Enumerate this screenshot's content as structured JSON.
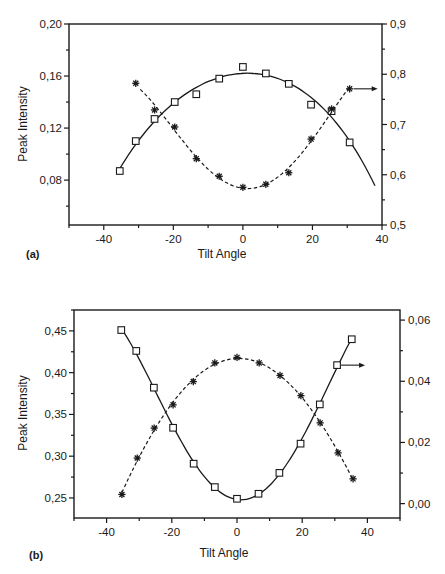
{
  "chart_data": [
    {
      "panel_label": "(a)",
      "type": "scatter",
      "xlabel": "Tilt Angle",
      "ylabel": "Peak Intensity",
      "y2label": "",
      "xlim": [
        -50,
        40
      ],
      "ylim": [
        0.0455,
        0.2
      ],
      "y2lim": [
        0.5,
        0.9
      ],
      "xticks": [
        -40,
        -20,
        0,
        20,
        40
      ],
      "xtick_labels": [
        "-40",
        "-20",
        "0",
        "20",
        "40"
      ],
      "yticks": [
        0.08,
        0.12,
        0.16,
        0.2
      ],
      "ytick_labels": [
        "0,08",
        "0,12",
        "0,16",
        "0,20"
      ],
      "y2ticks": [
        0.5,
        0.6,
        0.7,
        0.8,
        0.9
      ],
      "y2tick_labels": [
        "0,5",
        "0,6",
        "0,7",
        "0,8",
        "0,9"
      ],
      "grid": false,
      "legend": "none",
      "series": [
        {
          "name": "squares",
          "marker": "square",
          "axis": "left",
          "fit": "solid",
          "x": [
            -35.4,
            -30.8,
            -25.4,
            -19.6,
            -13.4,
            -6.8,
            0,
            6.6,
            13.2,
            19.6,
            25.5,
            30.7
          ],
          "y": [
            0.087,
            0.11,
            0.127,
            0.14,
            0.146,
            0.158,
            0.167,
            0.162,
            0.154,
            0.138,
            0.133,
            0.109
          ],
          "fit_amp": 0.167,
          "fit_width": 56,
          "fit_x0": 1,
          "fit_base": 0.0,
          "fit_range": [
            -35.4,
            38
          ]
        },
        {
          "name": "asterisks",
          "marker": "asterisk",
          "axis": "right",
          "fit": "dashed",
          "arrow": "right",
          "x": [
            -30.8,
            -25.4,
            -19.6,
            -13.4,
            -6.8,
            0,
            6.6,
            13.2,
            19.6,
            25.5,
            30.7
          ],
          "y": [
            0.782,
            0.729,
            0.695,
            0.632,
            0.597,
            0.575,
            0.581,
            0.604,
            0.671,
            0.731,
            0.771
          ],
          "fit_range": [
            -29.5,
            30.7
          ]
        }
      ]
    },
    {
      "panel_label": "(b)",
      "type": "scatter",
      "xlabel": "Tilt Angle",
      "ylabel": "Peak Intensity",
      "y2label": "",
      "xlim": [
        -50,
        50
      ],
      "ylim": [
        0.226,
        0.475
      ],
      "y2lim": [
        -0.0047,
        0.0633
      ],
      "xticks": [
        -40,
        -20,
        0,
        20,
        40
      ],
      "xtick_labels": [
        "-40",
        "-20",
        "0",
        "20",
        "40"
      ],
      "yticks": [
        0.25,
        0.3,
        0.35,
        0.4,
        0.45
      ],
      "ytick_labels": [
        "0,25",
        "0,30",
        "0,35",
        "0,40",
        "0,45"
      ],
      "y2ticks": [
        0.0,
        0.02,
        0.04,
        0.06
      ],
      "y2tick_labels": [
        "0,00",
        "0,02",
        "0,04",
        "0,06"
      ],
      "grid": false,
      "legend": "none",
      "series": [
        {
          "name": "squares",
          "marker": "square",
          "axis": "left",
          "fit": "solid",
          "arrow": "right",
          "arrow_point_index": 11,
          "x": [
            -35.5,
            -30.9,
            -25.5,
            -19.6,
            -13.3,
            -6.8,
            0,
            6.6,
            13.0,
            19.5,
            25.4,
            30.7,
            35.2
          ],
          "y": [
            0.451,
            0.426,
            0.382,
            0.334,
            0.291,
            0.263,
            0.249,
            0.255,
            0.28,
            0.315,
            0.362,
            0.409,
            0.44
          ],
          "fit_range": [
            -34.5,
            35
          ]
        },
        {
          "name": "asterisks",
          "marker": "asterisk",
          "axis": "right",
          "fit": "dashed",
          "x": [
            -35.3,
            -30.6,
            -25.4,
            -19.6,
            -13.4,
            -6.8,
            0,
            6.8,
            13.2,
            19.6,
            25.5,
            31.0,
            35.6
          ],
          "y": [
            0.003,
            0.0149,
            0.0247,
            0.0323,
            0.0399,
            0.046,
            0.0478,
            0.046,
            0.0419,
            0.0353,
            0.0264,
            0.0166,
            0.0081
          ],
          "fit_range": [
            -35.3,
            35.6
          ]
        }
      ]
    }
  ],
  "panels": [
    {
      "label": "(a)",
      "xlabel": "Tilt Angle",
      "ylabel": "Peak Intensity"
    },
    {
      "label": "(b)",
      "xlabel": "Tilt Angle",
      "ylabel": "Peak Intensity"
    }
  ],
  "colors": {
    "ink": "#1a1a1a",
    "background": "#ffffff"
  }
}
